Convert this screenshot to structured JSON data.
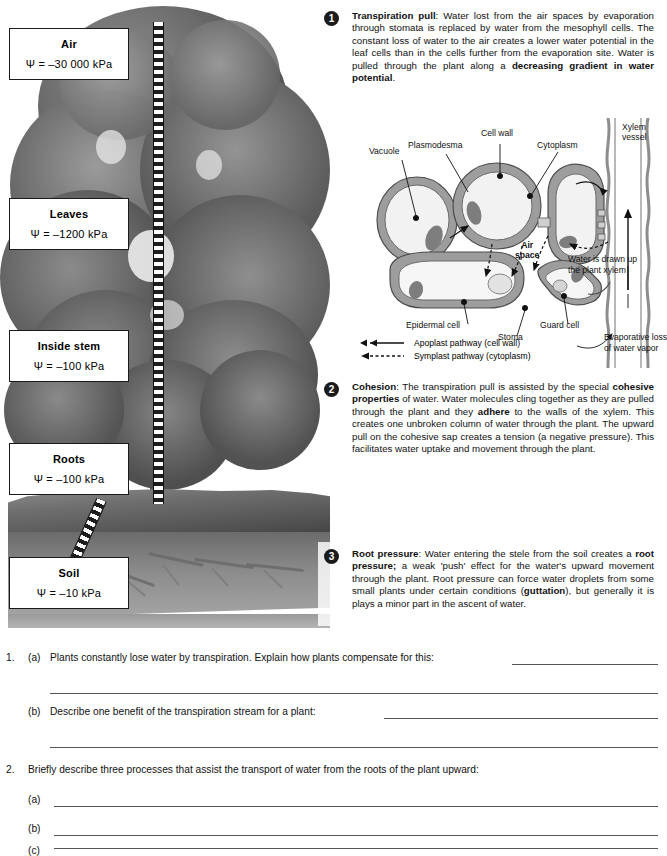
{
  "water_potential_boxes": [
    {
      "name": "Air",
      "value": "Ψ  = –30 000 kPa"
    },
    {
      "name": "Leaves",
      "value": "Ψ  = –1200 kPa"
    },
    {
      "name": "Inside stem",
      "value": "Ψ  = –100 kPa"
    },
    {
      "name": "Roots",
      "value": "Ψ  = –100 kPa"
    },
    {
      "name": "Soil",
      "value": "Ψ  = –10 kPa"
    }
  ],
  "steps": [
    {
      "number": "1",
      "title": "Transpiration pull",
      "body_1": ": Water lost from the air spaces by evaporation through stomata is replaced by water from the mesophyll cells. The constant loss of water to the air creates a lower water potential in the leaf cells than in the cells further from the evaporation site. Water is pulled through the plant along a ",
      "emphasis_1": "decreasing gradient in water potential",
      "body_2": "."
    },
    {
      "number": "2",
      "title": "Cohesion",
      "body_1": ": The transpiration pull is assisted by the special ",
      "emphasis_1": "cohesive properties",
      "body_2": " of water. Water molecules cling together as they are pulled through the plant and they ",
      "emphasis_2": "adhere",
      "body_3": " to the walls of the xylem. This creates one unbroken column of water through the plant. The upward pull on the cohesive sap creates a tension (a negative pressure). This facilitates water uptake and movement through the plant."
    },
    {
      "number": "3",
      "title": "Root pressure",
      "body_1": ": Water entering the stele from the soil creates a ",
      "emphasis_1": "root pressure;",
      "body_2": " a weak 'push' effect for the water's upward movement through the plant. Root pressure can force water droplets from some small plants under certain conditions (",
      "emphasis_2": "guttation",
      "body_3": "), but generally it is plays a minor part in the ascent of water."
    }
  ],
  "cell_diagram": {
    "labels": {
      "vacuole": "Vacuole",
      "plasmodesma": "Plasmodesma",
      "cell_wall": "Cell wall",
      "cytoplasm": "Cytoplasm",
      "xylem_vessel_l1": "Xylem",
      "xylem_vessel_l2": "vessel",
      "air_space_l1": "Air",
      "air_space_l2": "space",
      "epidermal_cell": "Epidermal cell",
      "stoma": "Stoma",
      "guard_cell": "Guard cell",
      "water_drawn_l1": "Water is drawn up",
      "water_drawn_l2": "the plant xylem",
      "evaporative_l1": "Evaporative loss",
      "evaporative_l2": "of water vapor"
    },
    "legend": [
      {
        "key": "apoplast-pathway",
        "label": "Apoplast pathway (cell wall)",
        "style": "solid"
      },
      {
        "key": "symplast-pathway",
        "label": "Symplast pathway (cytoplasm)",
        "style": "dashed"
      }
    ]
  },
  "questions": [
    {
      "number": "1.",
      "parts": [
        {
          "label": "(a)",
          "text": "Plants constantly lose water by transpiration. Explain how plants compensate for this:"
        },
        {
          "label": "(b)",
          "text": "Describe one benefit of the transpiration stream for a plant:"
        }
      ]
    },
    {
      "number": "2.",
      "stem": "Briefly describe three processes that assist the transport of water from the roots of the plant upward:",
      "parts": [
        {
          "label": "(a)",
          "text": ""
        },
        {
          "label": "(b)",
          "text": ""
        },
        {
          "label": "(c)",
          "text": ""
        }
      ]
    }
  ],
  "colors": {
    "ink": "#111111",
    "rule": "#555555",
    "badge_bg": "#1b1b1b",
    "cell_wall": "#9a9a9a",
    "cytoplasm": "#e9e9e9"
  }
}
